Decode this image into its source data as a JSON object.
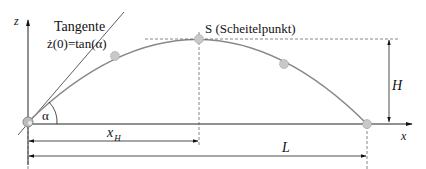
{
  "diagram": {
    "labels": {
      "z_axis": "z",
      "x_axis": "x",
      "tangent": "Tangente",
      "tangent_formula": "ż(0)=tan(α)",
      "apex": "S (Scheitelpunkt)",
      "angle": "α",
      "height": "H",
      "apex_distance": "x",
      "apex_distance_sub": "H",
      "range": "L"
    },
    "colors": {
      "curve": "#888888",
      "point_fill": "#c8c8c8",
      "point_stroke": "#999999",
      "axis": "#222222",
      "dashed": "#555555"
    }
  }
}
